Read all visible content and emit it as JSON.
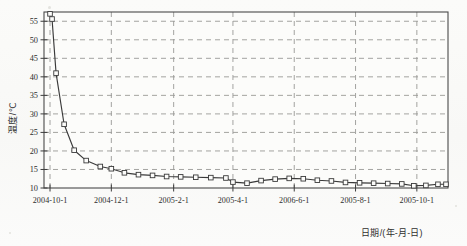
{
  "chart_data": {
    "type": "line",
    "title": "",
    "xlabel": "日期/(年-月-日)",
    "ylabel": "温度/℃",
    "grid": true,
    "legend": null,
    "ylim": [
      10,
      57.5
    ],
    "yticks": [
      10,
      15,
      20,
      25,
      30,
      35,
      40,
      45,
      50,
      55
    ],
    "ytick_labels": [
      "10",
      "15",
      "20",
      "25",
      "30",
      "35",
      "40",
      "45",
      "50",
      "55"
    ],
    "xtick_labels": [
      "2004-10-1",
      "2004-12-1",
      "2005-2-1",
      "2005-4-1",
      "2006-6-1",
      "2005-8-1",
      "2005-10-1"
    ],
    "xtick_positions": [
      0,
      61,
      123,
      182,
      243,
      304,
      365
    ],
    "xlim": [
      -6,
      396
    ],
    "marker": "open-square",
    "line_color": "#3a3a3a",
    "grid_color": "#9a9a96",
    "frame_color": "#4a4a4a",
    "series": [
      {
        "name": "水温",
        "x": [
          0,
          2,
          6,
          14,
          24,
          36,
          50,
          61,
          74,
          88,
          102,
          116,
          130,
          145,
          160,
          175,
          182,
          196,
          210,
          224,
          238,
          252,
          266,
          280,
          294,
          308,
          322,
          336,
          350,
          362,
          374,
          386,
          394
        ],
        "values": [
          57.0,
          55.6,
          41.0,
          27.2,
          20.2,
          17.4,
          15.8,
          15.2,
          14.1,
          13.6,
          13.4,
          13.1,
          13.0,
          12.9,
          12.8,
          12.7,
          11.6,
          11.3,
          12.0,
          12.4,
          12.6,
          12.5,
          12.1,
          11.9,
          11.5,
          11.4,
          11.3,
          11.2,
          11.1,
          10.6,
          10.7,
          11.0,
          11.0
        ]
      }
    ]
  },
  "axis": {
    "y_title": "温度/℃",
    "x_title": "日期/(年-月-日)"
  }
}
